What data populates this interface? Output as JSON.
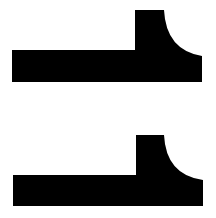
{
  "canvas": {
    "width": 216,
    "height": 218,
    "background": "#ffffff"
  },
  "shapes": [
    {
      "name": "profile-shape-top",
      "fill": "#000000"
    },
    {
      "name": "profile-shape-bottom",
      "fill": "#000000"
    }
  ]
}
